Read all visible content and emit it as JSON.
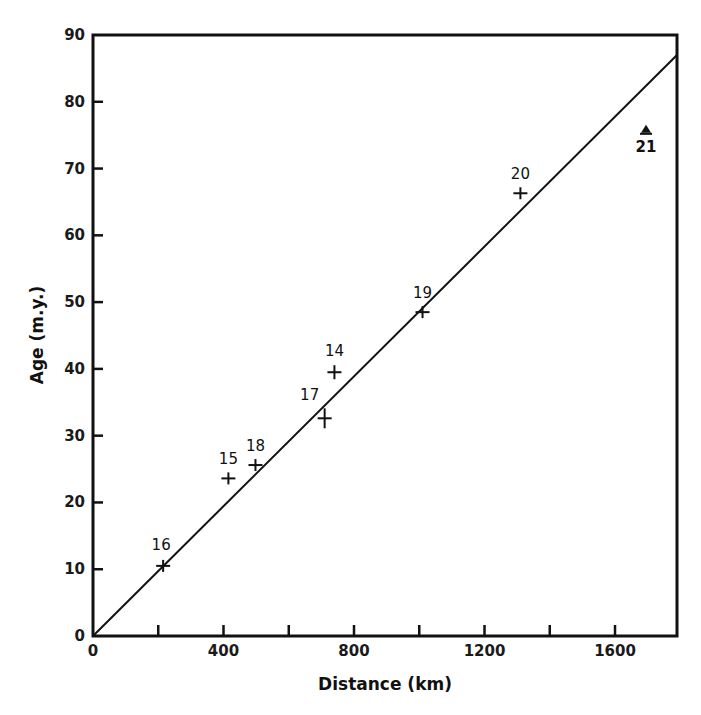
{
  "chart_data": {
    "type": "scatter",
    "title": "",
    "xlabel": "Distance (km)",
    "ylabel": "Age (m.y.)",
    "xlim": [
      0,
      1790
    ],
    "ylim": [
      0,
      90
    ],
    "grid": false,
    "legend": null,
    "x_ticks": [
      0,
      200,
      400,
      600,
      800,
      1000,
      1200,
      1400,
      1600
    ],
    "x_tick_labels": [
      "0",
      "",
      "400",
      "",
      "800",
      "",
      "1200",
      "",
      "1600"
    ],
    "y_ticks": [
      0,
      10,
      20,
      30,
      40,
      50,
      60,
      70,
      80,
      90
    ],
    "y_tick_labels": [
      "0",
      "10",
      "20",
      "30",
      "40",
      "50",
      "60",
      "70",
      "80",
      "90"
    ],
    "series": [
      {
        "name": "Sample ages",
        "marker": "cross-with-error-bar",
        "points": [
          {
            "label": "16",
            "x": 215,
            "y": 10.5
          },
          {
            "label": "15",
            "x": 415,
            "y": 23.6
          },
          {
            "label": "18",
            "x": 498,
            "y": 25.6
          },
          {
            "label": "17",
            "x": 710,
            "y": 32.6
          },
          {
            "label": "14",
            "x": 740,
            "y": 39.5
          },
          {
            "label": "19",
            "x": 1010,
            "y": 48.5
          },
          {
            "label": "20",
            "x": 1310,
            "y": 66.3
          }
        ]
      },
      {
        "name": "Outlier",
        "marker": "triangle",
        "points": [
          {
            "label": "21",
            "x": 1695,
            "y": 75.5
          }
        ]
      }
    ],
    "fit_line": {
      "x": [
        0,
        1790
      ],
      "y": [
        0,
        87
      ]
    }
  }
}
